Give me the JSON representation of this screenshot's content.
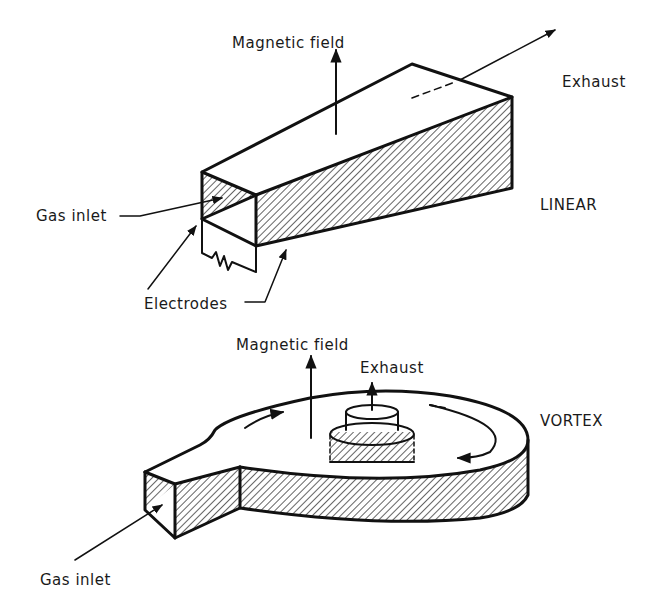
{
  "diagram": {
    "linear": {
      "title": "LINEAR",
      "labels": {
        "magnetic_field": "Magnetic field",
        "exhaust": "Exhaust",
        "gas_inlet": "Gas inlet",
        "electrodes": "Electrodes"
      }
    },
    "vortex": {
      "title": "VORTEX",
      "labels": {
        "magnetic_field": "Magnetic field",
        "exhaust": "Exhaust",
        "gas_inlet": "Gas inlet"
      }
    },
    "colors": {
      "ink": "#111111",
      "background": "#ffffff"
    }
  }
}
